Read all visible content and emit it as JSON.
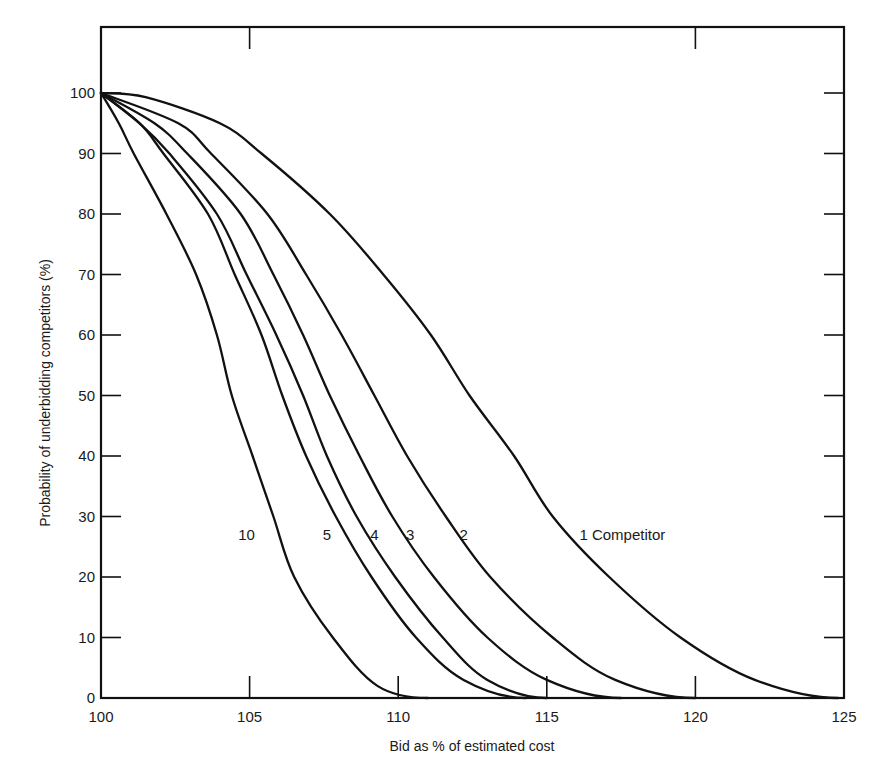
{
  "chart_data": {
    "type": "line",
    "title": "",
    "xlabel": "Bid as % of estimated cost",
    "ylabel": "Probability of underbidding competitors (%)",
    "xlim": [
      100,
      125
    ],
    "ylim": [
      0,
      110
    ],
    "xticks": [
      100,
      105,
      110,
      115,
      120,
      125
    ],
    "yticks": [
      0,
      10,
      20,
      30,
      40,
      50,
      60,
      70,
      80,
      90,
      100
    ],
    "grid": false,
    "legend": "inline curve labels",
    "series": [
      {
        "name": "1 Competitor",
        "label": "1 Competitor",
        "label_pos": [
          116.3,
          27
        ],
        "points": [
          [
            100,
            100
          ],
          [
            101.5,
            99.3
          ],
          [
            104.0,
            95
          ],
          [
            105.4,
            90
          ],
          [
            107.7,
            80
          ],
          [
            109.5,
            70
          ],
          [
            111.1,
            60
          ],
          [
            112.4,
            50
          ],
          [
            113.9,
            40
          ],
          [
            115.2,
            30
          ],
          [
            117.1,
            20
          ],
          [
            119.5,
            10
          ],
          [
            122.0,
            3
          ],
          [
            124.8,
            0
          ]
        ]
      },
      {
        "name": "2",
        "label": "2",
        "label_pos": [
          112.2,
          27
        ],
        "points": [
          [
            100,
            100
          ],
          [
            102.6,
            95
          ],
          [
            103.7,
            90
          ],
          [
            105.6,
            80
          ],
          [
            106.9,
            70
          ],
          [
            108.1,
            60
          ],
          [
            109.2,
            50
          ],
          [
            110.3,
            40
          ],
          [
            111.6,
            30
          ],
          [
            113.1,
            20
          ],
          [
            115.2,
            10
          ],
          [
            117.3,
            3
          ],
          [
            120.0,
            0
          ]
        ]
      },
      {
        "name": "3",
        "label": "3",
        "label_pos": [
          110.4,
          27
        ],
        "points": [
          [
            100,
            100
          ],
          [
            101.8,
            95
          ],
          [
            102.9,
            90
          ],
          [
            104.7,
            80
          ],
          [
            105.8,
            70
          ],
          [
            106.8,
            60
          ],
          [
            107.7,
            50
          ],
          [
            108.7,
            40
          ],
          [
            109.8,
            30
          ],
          [
            111.2,
            20
          ],
          [
            113.0,
            10
          ],
          [
            115.0,
            3
          ],
          [
            117.5,
            0
          ]
        ]
      },
      {
        "name": "4",
        "label": "4",
        "label_pos": [
          109.2,
          27
        ],
        "points": [
          [
            100,
            100
          ],
          [
            101.3,
            95
          ],
          [
            102.3,
            90
          ],
          [
            103.9,
            80
          ],
          [
            104.9,
            70
          ],
          [
            105.9,
            60
          ],
          [
            106.8,
            50
          ],
          [
            107.6,
            40
          ],
          [
            108.6,
            30
          ],
          [
            109.9,
            20
          ],
          [
            111.5,
            10
          ],
          [
            113.0,
            3
          ],
          [
            115.0,
            0
          ]
        ]
      },
      {
        "name": "5",
        "label": "5",
        "label_pos": [
          107.6,
          27
        ],
        "points": [
          [
            100,
            100
          ],
          [
            101.3,
            95
          ],
          [
            102.1,
            90
          ],
          [
            103.6,
            80
          ],
          [
            104.5,
            70
          ],
          [
            105.4,
            60
          ],
          [
            106.1,
            50
          ],
          [
            106.9,
            40
          ],
          [
            107.9,
            30
          ],
          [
            109.1,
            20
          ],
          [
            110.6,
            10
          ],
          [
            112.2,
            3
          ],
          [
            114.3,
            0
          ]
        ]
      },
      {
        "name": "10",
        "label": "10",
        "label_pos": [
          104.9,
          27
        ],
        "points": [
          [
            100,
            100
          ],
          [
            100.6,
            95
          ],
          [
            101.1,
            90
          ],
          [
            102.2,
            80
          ],
          [
            103.2,
            70
          ],
          [
            103.9,
            60
          ],
          [
            104.4,
            50
          ],
          [
            105.1,
            40
          ],
          [
            105.8,
            30
          ],
          [
            106.5,
            20
          ],
          [
            107.8,
            10
          ],
          [
            109.3,
            2
          ],
          [
            111.0,
            0
          ]
        ]
      }
    ]
  },
  "axes": {
    "x_title": "Bid as % of estimated cost",
    "y_title": "Probability of underbidding competitors (%)",
    "x_tick_labels": [
      "100",
      "105",
      "110",
      "115",
      "120",
      "125"
    ],
    "y_tick_labels": [
      "0",
      "10",
      "20",
      "30",
      "40",
      "50",
      "60",
      "70",
      "80",
      "90",
      "100"
    ]
  },
  "colors": {
    "line": "#111111",
    "text": "#1a1a1a",
    "background": "#ffffff"
  }
}
